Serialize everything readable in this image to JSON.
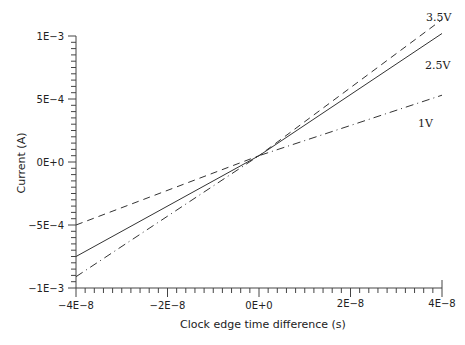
{
  "chart_data": {
    "type": "line",
    "title": "",
    "xlabel": "Clock edge time difference (s)",
    "ylabel": "Current (A)",
    "xlim": [
      -4e-08,
      4e-08
    ],
    "ylim": [
      -0.001,
      0.001
    ],
    "grid": false,
    "legend_position": "inline labels at right end of lines",
    "x_ticks": [
      -4e-08,
      -2e-08,
      0,
      2e-08,
      4e-08
    ],
    "x_tick_labels": [
      "−4E−8",
      "−2E−8",
      "0E+0",
      "2E−8",
      "4E−8"
    ],
    "y_ticks": [
      0.001,
      0.0005,
      0,
      -0.0005,
      -0.001
    ],
    "y_tick_labels": [
      "1E−3",
      "5E−4",
      "0E+0",
      "−5E−4",
      "−1E−3"
    ],
    "x_minor_divisions": 10,
    "y_minor_divisions": 10,
    "x": [
      -4e-08,
      0,
      4e-08
    ],
    "series": [
      {
        "name": "3.5V",
        "style": "dashed",
        "values": [
          -0.0005,
          5e-05,
          0.00113
        ]
      },
      {
        "name": "2.5V",
        "style": "solid",
        "values": [
          -0.00075,
          5e-05,
          0.00102
        ]
      },
      {
        "name": "1V",
        "style": "dash-dot",
        "values": [
          -0.00091,
          5e-05,
          0.00053
        ]
      }
    ]
  },
  "labels": {
    "xlabel": "Clock edge time difference (s)",
    "ylabel": "Current (A)",
    "series_3_5v": "3.5V",
    "series_2_5v": "2.5V",
    "series_1v": "1V",
    "xtick_0": "−4E−8",
    "xtick_1": "−2E−8",
    "xtick_2": "0E+0",
    "xtick_3": "2E−8",
    "xtick_4": "4E−8",
    "ytick_0": "1E−3",
    "ytick_1": "5E−4",
    "ytick_2": "0E+0",
    "ytick_3": "−5E−4",
    "ytick_4": "−1E−3"
  }
}
